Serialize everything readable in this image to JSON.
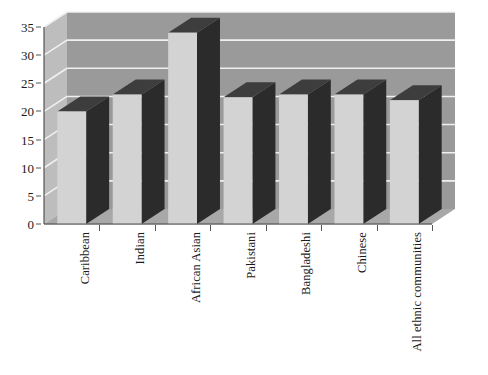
{
  "chart_data": {
    "type": "bar",
    "title": "",
    "subtitle": "",
    "xlabel": "",
    "ylabel": "",
    "categories": [
      "Caribbean",
      "Indian",
      "African Asian",
      "Pakistani",
      "Bangladeshi",
      "Chinese",
      "All ethnic communities"
    ],
    "values": [
      20,
      23,
      34,
      22.5,
      23,
      23,
      22
    ],
    "ylim": [
      0,
      35
    ],
    "yticks": [
      0,
      5,
      10,
      15,
      20,
      25,
      30,
      35
    ],
    "ytick_labels": [
      "0",
      "5",
      "10",
      "15",
      "20",
      "25",
      "30",
      "35"
    ],
    "grid": true,
    "grid_axis": "y",
    "legend": false,
    "legend_position": "none",
    "style": "3d-column",
    "series": [
      {
        "name": "",
        "values": [
          20,
          23,
          34,
          22.5,
          23,
          23,
          22
        ]
      }
    ]
  },
  "colors": {
    "bar_front": "#d3d3d3",
    "bar_side": "#2b2b2b",
    "bar_top": "#3d3d3d",
    "wall_back": "#9a9a9a",
    "wall_left": "#bdbdbd",
    "floor": "#a8a8a8",
    "gridline": "#f0f0f0",
    "axis": "#555555",
    "text": "#1a1a1a",
    "background": "#ffffff"
  },
  "icons": {
    "chart_icon": "bar-chart-icon"
  }
}
